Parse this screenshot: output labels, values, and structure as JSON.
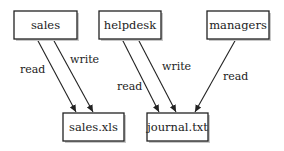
{
  "diagram": {
    "nodes": [
      {
        "id": "sales",
        "label": "sales",
        "kind": "group"
      },
      {
        "id": "helpdesk",
        "label": "helpdesk",
        "kind": "group"
      },
      {
        "id": "managers",
        "label": "managers",
        "kind": "group"
      },
      {
        "id": "sales_xls",
        "label": "sales.xls",
        "kind": "file"
      },
      {
        "id": "journal_txt",
        "label": "journal.txt",
        "kind": "file"
      }
    ],
    "edges": [
      {
        "from": "sales",
        "to": "sales_xls",
        "label": "read"
      },
      {
        "from": "sales",
        "to": "sales_xls",
        "label": "write"
      },
      {
        "from": "helpdesk",
        "to": "journal_txt",
        "label": "read"
      },
      {
        "from": "helpdesk",
        "to": "journal_txt",
        "label": "write"
      },
      {
        "from": "managers",
        "to": "journal_txt",
        "label": "read"
      }
    ],
    "colors": {
      "line": "#222222",
      "background": "#ffffff"
    }
  }
}
